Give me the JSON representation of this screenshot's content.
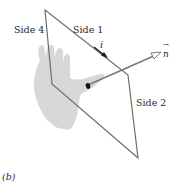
{
  "figure": {
    "panel_label": "(b)",
    "labels": {
      "side_1": "Side 1",
      "side_2": "Side 2",
      "side_4": "Side 4",
      "current": "i",
      "normal": "n",
      "normal_arrow_accent": "→"
    },
    "colors": {
      "loop_edge": "#6e6e6e",
      "hand": "#d6d6d6",
      "normal_arrow": "#7a7a7a",
      "current_arrow": "#1a1a1a",
      "text": "#2a2a2a"
    }
  }
}
